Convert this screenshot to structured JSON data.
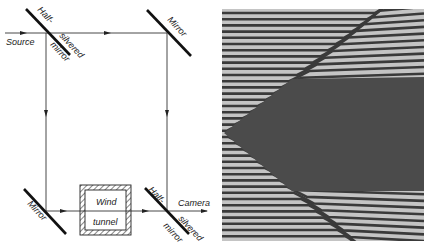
{
  "figure": {
    "left_panel": {
      "type": "interferometer-schematic",
      "labels": {
        "source": "Source",
        "half_silvered_mirror_top_1": "Half-",
        "half_silvered_mirror_top_2": "silvered",
        "half_silvered_mirror_top_3": "mirror",
        "mirror_top_right": "Mirror",
        "mirror_bottom_left": "Mirror",
        "wind_tunnel_1": "Wind",
        "wind_tunnel_2": "tunnel",
        "half_silvered_mirror_bottom_1": "Half-",
        "half_silvered_mirror_bottom_2": "silvered",
        "half_silvered_mirror_bottom_3": "mirror",
        "camera": "Camera"
      }
    },
    "right_panel": {
      "type": "interferogram-photo",
      "description": "Interference fringes deflected around a wedge-shaped body in a wind tunnel"
    },
    "colors": {
      "line": "#222222",
      "fringe_light": "#c8c8c8",
      "fringe_dark": "#3a3a3a",
      "body": "#4a4a4a"
    }
  }
}
